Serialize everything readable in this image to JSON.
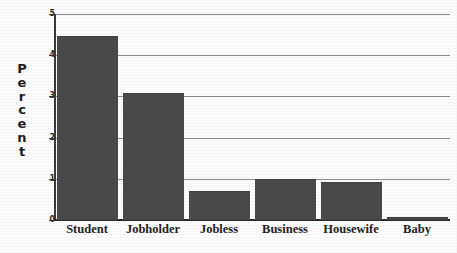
{
  "chart_data": {
    "type": "bar",
    "title": "",
    "xlabel": "",
    "ylabel": "Percent",
    "ylim": [
      0,
      5
    ],
    "yticks": [
      0,
      1,
      2,
      3,
      4,
      5
    ],
    "grid": true,
    "legend": "none",
    "categories": [
      "Student",
      "Jobholder",
      "Jobless",
      "Business",
      "Housewife",
      "Baby"
    ],
    "values": [
      4.45,
      3.05,
      0.68,
      0.97,
      0.9,
      0.05
    ],
    "bar_color": "#4a4a4a",
    "gridline_color": "#8d8d8d",
    "axis_color": "#2b2b2b"
  },
  "axis": {
    "y_title_letters": [
      "P",
      "e",
      "r",
      "c",
      "e",
      "n",
      "t"
    ],
    "y_tick_labels": [
      "0",
      "1",
      "2",
      "3",
      "4",
      "5"
    ]
  }
}
